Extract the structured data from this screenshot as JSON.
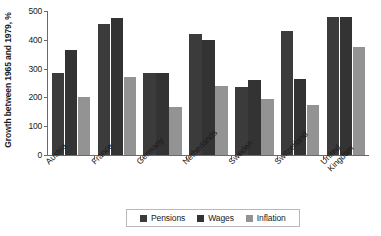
{
  "chart_data": {
    "type": "bar",
    "title": "",
    "xlabel": "",
    "ylabel": "Growth between 1965 and 1979, %",
    "ylim": [
      0,
      500
    ],
    "yticks": [
      0,
      100,
      200,
      300,
      400,
      500
    ],
    "grid": false,
    "legend_position": "bottom",
    "categories": [
      "Austria",
      "France",
      "Germany",
      "Netherlands",
      "Sweden",
      "Switzerland",
      "United Kingdom"
    ],
    "series": [
      {
        "name": "Pensions",
        "color": "#3b3b3b",
        "values": [
          285,
          455,
          285,
          420,
          235,
          430,
          480
        ]
      },
      {
        "name": "Wages",
        "color": "#333333",
        "values": [
          365,
          475,
          285,
          400,
          260,
          265,
          480
        ]
      },
      {
        "name": "Inflation",
        "color": "#939393",
        "values": [
          200,
          270,
          165,
          240,
          195,
          175,
          375
        ]
      }
    ]
  },
  "axis": {
    "y_title": "Growth between 1965 and 1979, %",
    "y_ticks": [
      "500",
      "400",
      "300",
      "200",
      "100",
      "0"
    ]
  },
  "categories": [
    {
      "label": "Austria"
    },
    {
      "label": "France"
    },
    {
      "label": "Germany"
    },
    {
      "label": "Netherlands"
    },
    {
      "label": "Sweden"
    },
    {
      "label": "Switzerland"
    },
    {
      "label": "United Kingdom",
      "line1": "United",
      "line2": "Kingdom"
    }
  ],
  "legend": {
    "items": [
      {
        "label": "Pensions",
        "color": "#3b3b3b"
      },
      {
        "label": "Wages",
        "color": "#333333"
      },
      {
        "label": "Inflation",
        "color": "#939393"
      }
    ]
  }
}
